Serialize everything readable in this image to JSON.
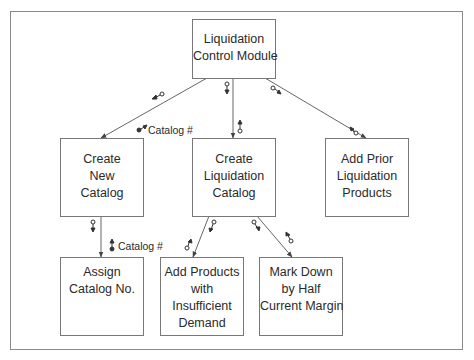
{
  "diagram": {
    "type": "structure-chart",
    "colors": {
      "line": "#666666",
      "box_border": "#777777",
      "text": "#2a2a2a",
      "frame": "#8a8a8a"
    },
    "modules": [
      {
        "id": "liquidation-control",
        "lines": [
          "Liquidation",
          "Control Module"
        ]
      },
      {
        "id": "create-new-catalog",
        "lines": [
          "Create",
          "New",
          "Catalog"
        ]
      },
      {
        "id": "create-liquidation-catalog",
        "lines": [
          "Create",
          "Liquidation",
          "Catalog"
        ]
      },
      {
        "id": "add-prior-liquidation-products",
        "lines": [
          "Add Prior",
          "Liquidation",
          "Products"
        ]
      },
      {
        "id": "assign-catalog-no",
        "lines": [
          "Assign",
          "Catalog No."
        ]
      },
      {
        "id": "add-products-insufficient-demand",
        "lines": [
          "Add Products",
          "with",
          "Insufficient",
          "Demand"
        ]
      },
      {
        "id": "mark-down-half-margin",
        "lines": [
          "Mark Down",
          "by Half",
          "Current Margin"
        ]
      }
    ],
    "connections": [
      {
        "from": "liquidation-control",
        "to": "create-new-catalog",
        "couples": [
          {
            "kind": "control-flag",
            "direction": "down"
          },
          {
            "kind": "data",
            "direction": "up",
            "label": "Catalog #"
          }
        ]
      },
      {
        "from": "liquidation-control",
        "to": "create-liquidation-catalog",
        "couples": [
          {
            "kind": "data",
            "direction": "down"
          },
          {
            "kind": "data",
            "direction": "up"
          }
        ]
      },
      {
        "from": "liquidation-control",
        "to": "add-prior-liquidation-products",
        "couples": [
          {
            "kind": "data",
            "direction": "down"
          },
          {
            "kind": "data",
            "direction": "up"
          }
        ]
      },
      {
        "from": "create-new-catalog",
        "to": "assign-catalog-no",
        "couples": [
          {
            "kind": "data",
            "direction": "down"
          },
          {
            "kind": "data",
            "direction": "up",
            "label": "Catalog #"
          }
        ]
      },
      {
        "from": "create-liquidation-catalog",
        "to": "add-products-insufficient-demand",
        "couples": [
          {
            "kind": "data",
            "direction": "down"
          },
          {
            "kind": "data",
            "direction": "up"
          }
        ]
      },
      {
        "from": "create-liquidation-catalog",
        "to": "mark-down-half-margin",
        "couples": [
          {
            "kind": "data",
            "direction": "down"
          },
          {
            "kind": "data",
            "direction": "up"
          }
        ]
      }
    ],
    "couple_labels": {
      "catalog_num_1": "Catalog #",
      "catalog_num_2": "Catalog #"
    }
  }
}
